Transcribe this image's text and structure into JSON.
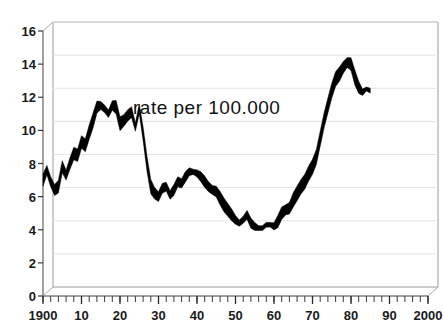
{
  "chart_data": {
    "type": "line",
    "title": "",
    "annotation": "rate per 100.000",
    "xlabel": "",
    "ylabel": "",
    "xlim": [
      1900,
      2000
    ],
    "ylim": [
      0,
      16
    ],
    "grid": true,
    "legend": null,
    "style": "thick-black-ribbon-line-3d-frame",
    "x_ticks": [
      {
        "value": 1900,
        "label": "1900"
      },
      {
        "value": 1910,
        "label": "10"
      },
      {
        "value": 1920,
        "label": "20"
      },
      {
        "value": 1930,
        "label": "30"
      },
      {
        "value": 1940,
        "label": "40"
      },
      {
        "value": 1950,
        "label": "50"
      },
      {
        "value": 1960,
        "label": "60"
      },
      {
        "value": 1970,
        "label": "70"
      },
      {
        "value": 1980,
        "label": "80"
      },
      {
        "value": 1990,
        "label": "90"
      },
      {
        "value": 2000,
        "label": "2000"
      }
    ],
    "x_minor_tick_interval": 2,
    "y_ticks": [
      {
        "value": 0,
        "label": "0"
      },
      {
        "value": 2,
        "label": "2"
      },
      {
        "value": 4,
        "label": "4"
      },
      {
        "value": 6,
        "label": "6"
      },
      {
        "value": 8,
        "label": "8"
      },
      {
        "value": 10,
        "label": "10"
      },
      {
        "value": 12,
        "label": "12"
      },
      {
        "value": 14,
        "label": "14"
      },
      {
        "value": 16,
        "label": "16"
      }
    ],
    "series": [
      {
        "name": "rate per 100.000",
        "color": "#000000",
        "x": [
          1900,
          1901,
          1902,
          1903,
          1904,
          1905,
          1906,
          1907,
          1908,
          1909,
          1910,
          1911,
          1912,
          1913,
          1914,
          1915,
          1916,
          1917,
          1918,
          1919,
          1920,
          1921,
          1922,
          1923,
          1924,
          1925,
          1926,
          1927,
          1928,
          1929,
          1930,
          1931,
          1932,
          1933,
          1934,
          1935,
          1936,
          1937,
          1938,
          1939,
          1940,
          1941,
          1942,
          1943,
          1944,
          1945,
          1946,
          1947,
          1948,
          1949,
          1950,
          1951,
          1952,
          1953,
          1954,
          1955,
          1956,
          1957,
          1958,
          1959,
          1960,
          1961,
          1962,
          1963,
          1964,
          1965,
          1966,
          1967,
          1968,
          1969,
          1970,
          1971,
          1972,
          1973,
          1974,
          1975,
          1976,
          1977,
          1978,
          1979,
          1980,
          1981,
          1982,
          1983,
          1984,
          1985
        ],
        "values": [
          7.0,
          7.6,
          6.9,
          6.4,
          6.6,
          7.8,
          7.3,
          8.0,
          8.6,
          8.5,
          9.3,
          9.1,
          9.9,
          10.6,
          11.4,
          11.5,
          11.3,
          11.0,
          11.5,
          11.4,
          10.4,
          10.6,
          10.9,
          11.1,
          10.2,
          11.3,
          9.8,
          8.0,
          6.6,
          6.2,
          6.0,
          6.5,
          6.6,
          6.1,
          6.4,
          6.9,
          6.8,
          7.2,
          7.5,
          7.5,
          7.4,
          7.2,
          6.9,
          6.6,
          6.4,
          6.3,
          5.9,
          5.5,
          5.2,
          4.9,
          4.6,
          4.4,
          4.6,
          4.9,
          4.4,
          4.2,
          4.1,
          4.1,
          4.3,
          4.3,
          4.2,
          4.5,
          5.0,
          5.2,
          5.3,
          5.8,
          6.2,
          6.6,
          6.9,
          7.4,
          7.8,
          8.4,
          9.5,
          10.6,
          11.5,
          12.4,
          13.1,
          13.4,
          13.8,
          14.1,
          14.0,
          13.2,
          12.6,
          12.3,
          12.5,
          12.4
        ]
      }
    ]
  }
}
